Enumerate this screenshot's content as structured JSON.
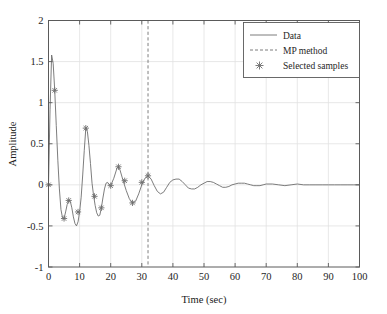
{
  "chart_data": {
    "type": "line",
    "title": "",
    "xlabel": "Time (sec)",
    "ylabel": "Amplitude",
    "xlim": [
      0,
      100
    ],
    "ylim": [
      -1,
      2
    ],
    "xticks": [
      0,
      10,
      20,
      30,
      40,
      50,
      60,
      70,
      80,
      90,
      100
    ],
    "xtick_labels": [
      "0",
      "10",
      "20",
      "30",
      "40",
      "50",
      "60",
      "70",
      "80",
      "90",
      "100"
    ],
    "yticks": [
      -1,
      -0.5,
      0,
      0.5,
      1,
      1.5,
      2
    ],
    "ytick_labels": [
      "-1",
      "-0.5",
      "0",
      "0.5",
      "1",
      "1.5",
      "2"
    ],
    "grid": true,
    "legend_position": "upper right",
    "legend": [
      {
        "label": "Data",
        "style": "solid-line",
        "color": "#707070"
      },
      {
        "label": "MP method",
        "style": "dashed-line",
        "color": "#707070"
      },
      {
        "label": "Selected samples",
        "style": "star-marker",
        "color": "#707070"
      }
    ],
    "series": [
      {
        "name": "Data",
        "style": "solid-line",
        "color": "#6e6e6e",
        "x": [
          0.0,
          0.5,
          1.0,
          1.5,
          2.0,
          2.5,
          3.0,
          3.5,
          4.0,
          4.5,
          5.0,
          5.5,
          6.0,
          6.5,
          7.0,
          7.5,
          8.0,
          8.5,
          9.0,
          9.5,
          10.0,
          10.5,
          11.0,
          11.5,
          12.0,
          12.5,
          13.0,
          13.5,
          14.0,
          14.5,
          15.0,
          15.5,
          16.0,
          16.5,
          17.0,
          17.5,
          18.0,
          18.5,
          19.0,
          19.5,
          20.0,
          21.0,
          22.0,
          22.5,
          23.0,
          24.0,
          25.0,
          26.0,
          27.0,
          28.0,
          29.0,
          30.0,
          31.0,
          32.0,
          33.0,
          34.0,
          35.0,
          36.0,
          37.0,
          38.0,
          39.0,
          40.0,
          41.0,
          42.0,
          43.0,
          44.0,
          45.0,
          46.0,
          47.0,
          48.0,
          49.0,
          50.0,
          51.0,
          52.0,
          53.0,
          54.0,
          55.0,
          56.0,
          57.0,
          58.0,
          59.0,
          60.0,
          61.0,
          62.0,
          63.0,
          64.0,
          65.0,
          66.0,
          67.0,
          68.0,
          69.0,
          70.0,
          72.0,
          74.0,
          76.0,
          78.0,
          80.0,
          82.0,
          84.0,
          86.0,
          88.0,
          90.0,
          92.0,
          94.0,
          96.0,
          98.0,
          100.0
        ],
        "y": [
          0.0,
          0.92,
          1.58,
          1.48,
          1.15,
          0.72,
          0.3,
          -0.05,
          -0.3,
          -0.4,
          -0.41,
          -0.33,
          -0.24,
          -0.19,
          -0.2,
          -0.28,
          -0.39,
          -0.47,
          -0.5,
          -0.45,
          -0.33,
          -0.15,
          0.12,
          0.42,
          0.69,
          0.65,
          0.48,
          0.26,
          0.02,
          -0.13,
          -0.25,
          -0.34,
          -0.38,
          -0.37,
          -0.28,
          -0.16,
          -0.05,
          0.02,
          0.03,
          0.0,
          -0.01,
          0.08,
          0.2,
          0.22,
          0.18,
          0.05,
          -0.07,
          -0.17,
          -0.22,
          -0.2,
          -0.11,
          0.0,
          0.08,
          0.11,
          0.07,
          -0.01,
          -0.08,
          -0.11,
          -0.09,
          -0.03,
          0.03,
          0.06,
          0.07,
          0.07,
          0.04,
          0.0,
          -0.04,
          -0.05,
          -0.05,
          -0.03,
          0.0,
          0.02,
          0.04,
          0.04,
          0.03,
          0.01,
          -0.01,
          -0.03,
          -0.03,
          -0.02,
          0.0,
          0.01,
          0.02,
          0.02,
          0.02,
          0.01,
          0.0,
          -0.01,
          -0.01,
          -0.01,
          0.0,
          0.01,
          0.01,
          0.0,
          -0.01,
          0.0,
          0.01,
          0.0,
          0.0,
          0.0,
          0.0,
          0.0,
          0.0,
          0.0,
          0.0,
          0.0,
          0.0
        ]
      },
      {
        "name": "Selected samples",
        "style": "star-marker",
        "color": "#6e6e6e",
        "x": [
          0.0,
          2.0,
          5.0,
          6.5,
          9.5,
          12.0,
          14.8,
          17.0,
          20.0,
          22.5,
          24.5,
          27.0,
          30.0,
          32.0
        ],
        "y": [
          0.0,
          1.15,
          -0.41,
          -0.19,
          -0.33,
          0.69,
          -0.14,
          -0.28,
          -0.01,
          0.22,
          0.05,
          -0.22,
          0.03,
          0.11
        ]
      }
    ],
    "vertical_markers": [
      {
        "name": "MP method",
        "x": 32,
        "style": "dashed-line",
        "color": "#707070"
      }
    ]
  }
}
